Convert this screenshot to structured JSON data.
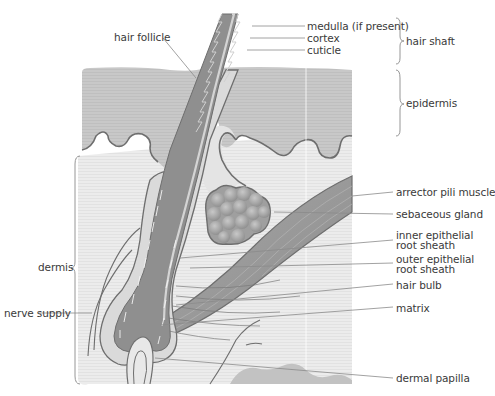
{
  "figure": {
    "colors": {
      "background": "#ffffff",
      "epidermis": "#c9c9c9",
      "dermis": "#ececec",
      "shaft_dark": "#8f8f8f",
      "shaft_light": "#bdbdbd",
      "follicle_sheath": "#d6d6d6",
      "muscle": "#9a9a9a",
      "gland": "#a8a8a8",
      "outline": "#6e6e6e",
      "leader_line": "#8a8a8a",
      "label_text": "#3a3a3a"
    },
    "labels": {
      "hair_follicle": "hair follicle",
      "medulla": "medulla (if present)",
      "cortex": "cortex",
      "cuticle": "cuticle",
      "hair_shaft": "hair shaft",
      "epidermis": "epidermis",
      "dermis": "dermis",
      "nerve_supply": "nerve supply",
      "arrector_pili_muscle": "arrector pili muscle",
      "sebaceous_gland": "sebaceous gland",
      "inner_root_sheath_1": "inner epithelial",
      "inner_root_sheath_2": "root sheath",
      "outer_root_sheath_1": "outer epithelial",
      "outer_root_sheath_2": "root sheath",
      "hair_bulb": "hair bulb",
      "matrix": "matrix",
      "dermal_papilla": "dermal papilla"
    }
  }
}
